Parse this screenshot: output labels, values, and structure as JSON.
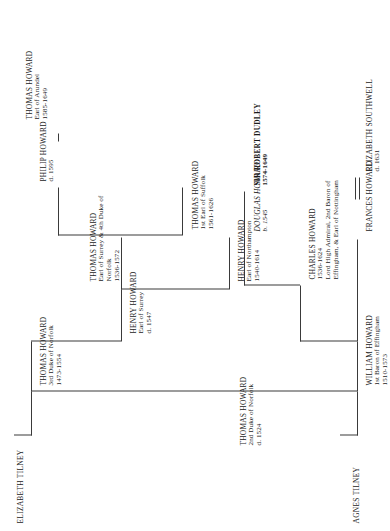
{
  "document": {
    "title": "Howard Family Tree"
  },
  "spouses": [
    {
      "id": "elizabeth-tilney",
      "label": "ELIZABETH TILNEY"
    },
    {
      "id": "agnes-tilney",
      "label": "AGNES TILNEY"
    }
  ],
  "people": [
    {
      "id": "thomas-howard-2nd-duke",
      "name": "THOMAS HOWARD",
      "title": "2nd Duke of Norfolk",
      "dates": "d. 1524"
    },
    {
      "id": "thomas-howard-3rd-duke",
      "name": "THOMAS HOWARD",
      "title": "3rd Duke of Norfolk",
      "dates": "1473-1554"
    },
    {
      "id": "henry-howard-earl-surrey",
      "name": "HENRY HOWARD",
      "title": "Earl of Surrey",
      "dates": "d. 1547"
    },
    {
      "id": "henry-howard-earl-northampton",
      "name": "HENRY HOWARD",
      "title": "Earl of Northampton",
      "dates": "1540-1614"
    },
    {
      "id": "thomas-howard-4th-duke",
      "name": "THOMAS HOWARD",
      "title": "Earl of Surrey & 4th Duke of Norfolk",
      "dates": "1536-1572"
    },
    {
      "id": "thomas-howard-earl-suffolk",
      "name": "THOMAS HOWARD",
      "title": "1st Earl of Suffolk",
      "dates": "1561-1626"
    },
    {
      "id": "philip-howard",
      "name": "PHILIP HOWARD",
      "title": "",
      "dates": "d. 1595"
    },
    {
      "id": "thomas-howard-earl-arundel",
      "name": "THOMAS HOWARD",
      "title": "Earl of Arundel",
      "dates": "1585-1649"
    },
    {
      "id": "william-howard",
      "name": "WILLIAM HOWARD",
      "title": "1st Baron of Effingham",
      "dates": "1510-1573"
    },
    {
      "id": "charles-howard",
      "name": "CHARLES HOWARD",
      "title": "Lord High Admiral, 2nd Baron of Effingham, & Earl of Nottingham",
      "dates": "1536-1624"
    },
    {
      "id": "douglas-howard",
      "name": "DOUGLAS HOWARD",
      "title": "",
      "dates": "b. 1545"
    },
    {
      "id": "sir-robert-dudley",
      "name": "SIR ROBERT DUDLEY",
      "title": "",
      "dates": "1574-1649"
    },
    {
      "id": "frances-howard",
      "name": "FRANCES HOWARD",
      "title": "",
      "dates": ""
    },
    {
      "id": "elizabeth-southwell",
      "name": "ELIZABETH SOUTHWELL",
      "title": "",
      "dates": "d. 1631"
    }
  ]
}
